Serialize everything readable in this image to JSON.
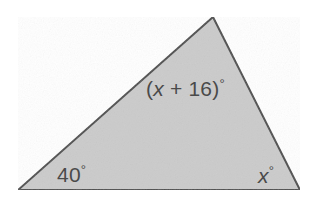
{
  "figure": {
    "kind": "triangle-angle-diagram",
    "width": 313,
    "height": 212,
    "background_color": "#ffffff",
    "fill_color": "#cbcbcb",
    "stroke_color": "#4d4d4d",
    "stroke_width": 2,
    "text_color": "#4a4a4a",
    "vertices": {
      "apex": [
        213,
        17
      ],
      "bottom_left": [
        18,
        190
      ],
      "bottom_right": [
        300,
        190
      ]
    },
    "polygon_points": "213,17 300,190 18,190"
  },
  "labels": {
    "apex": {
      "full_text": "(x + 16)°",
      "prefix": "(",
      "variable": "x",
      "operator": " + ",
      "constant": "16",
      "suffix": ")",
      "degree": "°"
    },
    "bottom_left": {
      "full_text": "40°",
      "value": "40",
      "degree": "°"
    },
    "bottom_right": {
      "full_text": "x°",
      "variable": "x",
      "degree": "°"
    }
  }
}
